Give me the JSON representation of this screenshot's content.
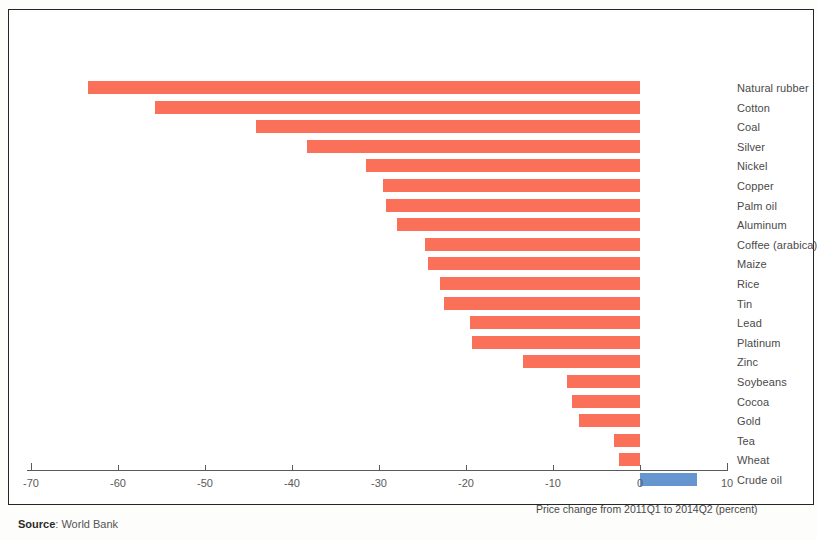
{
  "figure": {
    "source_prefix": "Source",
    "source_separator": ": ",
    "source_value": "World Bank"
  },
  "colors": {
    "negative_bar": "#fa7059",
    "positive_bar": "#6596d0",
    "frame": "#262626",
    "axis": "#5a5a5a",
    "label_text": "#4a4a4a"
  },
  "chart_data": {
    "type": "bar",
    "orientation": "horizontal",
    "title": "",
    "subtitle": "",
    "xlabel": "Price change from 2011Q1 to 2014Q2 (percent)",
    "ylabel": "",
    "xlim": [
      -70,
      10
    ],
    "xticks": [
      -70,
      -60,
      -50,
      -40,
      -30,
      -20,
      -10,
      0,
      10
    ],
    "xticklabels": [
      "-70",
      "-60",
      "-50",
      "-40",
      "-30",
      "-20",
      "-10",
      "0",
      "10"
    ],
    "grid": false,
    "legend": null,
    "categories": [
      "Natural rubber",
      "Cotton",
      "Coal",
      "Silver",
      "Nickel",
      "Copper",
      "Palm oil",
      "Aluminum",
      "Coffee (arabica)",
      "Maize",
      "Rice",
      "Tin",
      "Lead",
      "Platinum",
      "Zinc",
      "Soybeans",
      "Cocoa",
      "Gold",
      "Tea",
      "Wheat",
      "Crude oil"
    ],
    "values": [
      -63.5,
      -55.7,
      -44.1,
      -38.3,
      -31.5,
      -29.5,
      -29.2,
      -27.9,
      -24.7,
      -24.4,
      -23.0,
      -22.5,
      -19.5,
      -19.3,
      -13.4,
      -8.4,
      -7.8,
      -7.0,
      -3.0,
      -2.4,
      6.5
    ]
  }
}
